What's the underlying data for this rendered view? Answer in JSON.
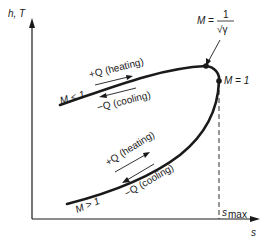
{
  "diagram": {
    "type": "Rayleigh line (h-s / T-s diagram)",
    "y_axis_label": "h, T",
    "x_axis_label": "s",
    "s_max_label": "s",
    "s_max_subscript": "max",
    "upper_branch": {
      "region_label": "M < 1",
      "heating_label": "+Q (heating)",
      "cooling_label": "−Q (cooling)"
    },
    "lower_branch": {
      "region_label": "M > 1",
      "heating_label": "+Q (heating)",
      "cooling_label": "−Q (cooling)"
    },
    "points": {
      "max_enthalpy": {
        "label_lhs": "M =",
        "numerator": "1",
        "denominator": "√γ"
      },
      "sonic": {
        "label": "M = 1"
      }
    },
    "colors": {
      "ink": "#1a1a1a",
      "background": "#ffffff"
    }
  }
}
